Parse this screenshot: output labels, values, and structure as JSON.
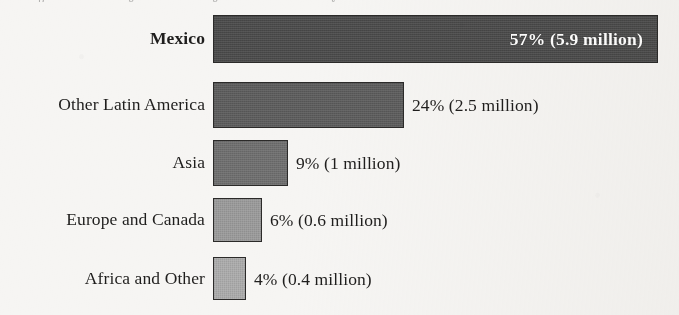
{
  "figure": {
    "background_color": "#f6f5f3",
    "clipped_header_fragments": [
      "p",
      "g",
      "g",
      "y"
    ]
  },
  "chart_data": {
    "type": "bar",
    "orientation": "horizontal",
    "title": "",
    "subtitle": "",
    "xlabel": "",
    "ylabel": "",
    "grid": false,
    "legend": "none",
    "xlim": [
      0,
      57
    ],
    "categories": [
      "Mexico",
      "Other Latin America",
      "Asia",
      "Europe and Canada",
      "Africa and Other"
    ],
    "values": [
      57,
      24,
      9,
      6,
      4
    ],
    "value_unit": "percent",
    "counts_millions": [
      5.9,
      2.5,
      1.0,
      0.6,
      0.4
    ],
    "data_labels": [
      "57% (5.9 million)",
      "24% (2.5 million)",
      "9% (1 million)",
      "6% (0.6 million)",
      "4% (0.4 million)"
    ],
    "bar_colors": [
      "#4a4a4a",
      "#5c5c5c",
      "#6e6e6e",
      "#9a9a9a",
      "#ababab"
    ],
    "bar_border_color": "#2b2a29",
    "label_emphasis": [
      true,
      false,
      false,
      false,
      false
    ],
    "label_placement": [
      "inside",
      "outside",
      "outside",
      "outside",
      "outside"
    ],
    "label_text_colors": [
      "#ffffff",
      "#1f1e1d",
      "#1f1e1d",
      "#1f1e1d",
      "#1f1e1d"
    ],
    "bars": [
      {
        "category": "Mexico",
        "percent": 57,
        "count": "5.9 million",
        "data_label": "57% (5.9 million)",
        "color": "#4a4a4a",
        "top": 15,
        "height": 48,
        "width": 445
      },
      {
        "category": "Other Latin America",
        "percent": 24,
        "count": "2.5 million",
        "data_label": "24% (2.5 million)",
        "color": "#5c5c5c",
        "top": 82,
        "height": 46,
        "width": 191
      },
      {
        "category": "Asia",
        "percent": 9,
        "count": "1 million",
        "data_label": "9% (1 million)",
        "color": "#6e6e6e",
        "top": 140,
        "height": 46,
        "width": 75
      },
      {
        "category": "Europe and Canada",
        "percent": 6,
        "count": "0.6 million",
        "data_label": "6% (0.6 million)",
        "color": "#9a9a9a",
        "top": 198,
        "height": 44,
        "width": 49
      },
      {
        "category": "Africa and Other",
        "percent": 4,
        "count": "0.4 million",
        "data_label": "4% (0.4 million)",
        "color": "#ababab",
        "top": 257,
        "height": 43,
        "width": 33
      }
    ]
  }
}
